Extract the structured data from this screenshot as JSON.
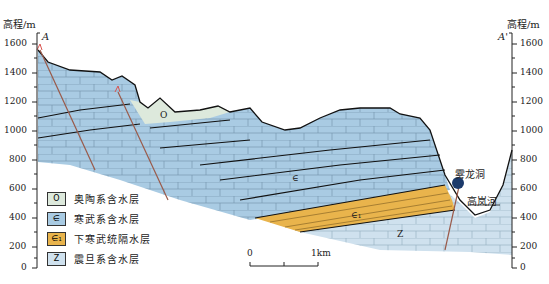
{
  "diagram": {
    "type": "geological cross-section",
    "left_axis": {
      "title": "高程/m",
      "corner_label": "A",
      "ticks": [
        "1600",
        "1400",
        "1200",
        "1000",
        "800",
        "600",
        "400",
        "200",
        "0"
      ]
    },
    "right_axis": {
      "title": "高程/m",
      "corner_label": "A'",
      "ticks": [
        "1600",
        "1400",
        "1200",
        "1000",
        "800",
        "600",
        "400",
        "200",
        "0"
      ]
    },
    "unit_labels": {
      "O": "O",
      "cambrian": "∈",
      "lower_cambrian": "∈₁",
      "sinian": "Z"
    },
    "annotations": {
      "cave": "雾龙洞",
      "river": "高岚河"
    },
    "scale_bar": {
      "start": "0",
      "end": "1km"
    },
    "legend": [
      {
        "symbol": "O",
        "label": "奥陶系含水层",
        "color": "#dde9dc"
      },
      {
        "symbol": "∈",
        "label": "寒武系含水层",
        "color": "#a9cbe3"
      },
      {
        "symbol": "∈₁",
        "label": "下寒武统隔水层",
        "color": "#e9b44c"
      },
      {
        "symbol": "Z",
        "label": "震旦系含水层",
        "color": "#cfe1ee"
      }
    ],
    "colors": {
      "ordovician": "#dde9dc",
      "cambrian": "#a9cbe3",
      "lower_cambrian": "#e9b44c",
      "sinian": "#cfe1ee",
      "fault": "#9a5a4a",
      "cave": "#1b3a6b"
    }
  }
}
